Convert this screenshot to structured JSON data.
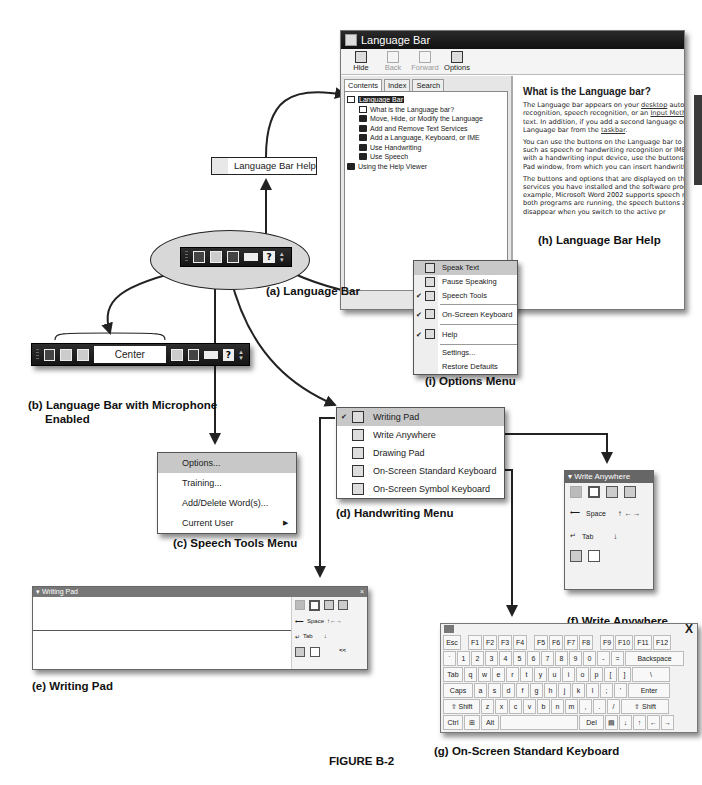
{
  "figure_label": "FIGURE B-2",
  "captions": {
    "a": "(a) Language Bar",
    "b_line1": "(b) Language Bar with Microphone",
    "b_line2": "Enabled",
    "c": "(c) Speech Tools Menu",
    "d": "(d) Handwriting Menu",
    "e": "(e) Writing Pad",
    "f": "(f) Write Anywhere",
    "g": "(g) On-Screen Standard Keyboard",
    "h": "(h) Language Bar Help",
    "i": "(i) Options Menu"
  },
  "help_window": {
    "title": "Language Bar",
    "toolbar": [
      {
        "label": "Hide",
        "enabled": true
      },
      {
        "label": "Back",
        "enabled": false
      },
      {
        "label": "Forward",
        "enabled": false
      },
      {
        "label": "Options",
        "enabled": true
      }
    ],
    "tabs": [
      "Contents",
      "Index",
      "Search"
    ],
    "tree": [
      {
        "label": "Language Bar",
        "level": 0,
        "icon": "open-book-icon",
        "selected": true
      },
      {
        "label": "What is the Language bar?",
        "level": 1,
        "icon": "page-icon"
      },
      {
        "label": "Move, Hide, or Modify the Language",
        "level": 1,
        "icon": "book-icon"
      },
      {
        "label": "Add and Remove Text Services",
        "level": 1,
        "icon": "book-icon"
      },
      {
        "label": "Add a Language, Keyboard, or IME",
        "level": 1,
        "icon": "book-icon"
      },
      {
        "label": "Use Handwriting",
        "level": 1,
        "icon": "book-icon"
      },
      {
        "label": "Use Speech",
        "level": 1,
        "icon": "book-icon"
      },
      {
        "label": "Using the Help Viewer",
        "level": 0,
        "icon": "book-icon"
      }
    ],
    "heading": "What is the Language bar?",
    "paragraphs": [
      [
        "The Language bar appears on your ",
        "desktop",
        " automa"
      ],
      [
        "recognition, speech recognition, or an ",
        "Input Method",
        ""
      ],
      [
        "text. In addition, if you add a second language or k",
        "",
        ""
      ],
      [
        "Language bar from the ",
        "taskbar",
        "."
      ]
    ],
    "para2": [
      "You can use the buttons on the Language bar to pe",
      "such as speech or handwriting recognition or IMEs.",
      "with a handwriting input device, use the buttons on t",
      "Pad window, from which you can insert handwritten"
    ],
    "para3": [
      "The buttons and options that are displayed on the",
      "services you have installed and the software progr",
      "example, Microsoft Word 2002 supports speech rec",
      "both programs are running, the speech buttons are",
      "disappear when you switch to the active pr"
    ]
  },
  "tooltip": {
    "label": "Language Bar Help"
  },
  "options_menu": {
    "items": [
      {
        "label": "Speak Text",
        "checked": false,
        "highlighted": true
      },
      {
        "label": "Pause Speaking",
        "checked": false
      },
      {
        "label": "Speech Tools",
        "checked": true
      },
      {
        "label": "On-Screen Keyboard",
        "checked": true
      },
      {
        "label": "Help",
        "checked": true
      },
      {
        "label": "Settings...",
        "checked": false
      },
      {
        "label": "Restore Defaults",
        "checked": false
      }
    ],
    "check_glyph": "✔"
  },
  "langbar_b": {
    "mode_label": "Center"
  },
  "speech_tools_menu": {
    "items": [
      {
        "label": "Options...",
        "highlighted": true
      },
      {
        "label": "Training..."
      },
      {
        "label": "Add/Delete Word(s)..."
      },
      {
        "label": "Current User",
        "submenu": true
      }
    ],
    "submenu_glyph": "▶"
  },
  "handwriting_menu": {
    "items": [
      {
        "label": "Writing Pad",
        "checked": true,
        "highlighted": true
      },
      {
        "label": "Write Anywhere"
      },
      {
        "label": "Drawing Pad"
      },
      {
        "label": "On-Screen Standard Keyboard"
      },
      {
        "label": "On-Screen Symbol Keyboard"
      }
    ]
  },
  "write_anywhere": {
    "title": "▾ Write Anywhere",
    "space_label": "Space",
    "tab_label": "Tab"
  },
  "writing_pad": {
    "title": "▾ Writing Pad",
    "close": "×",
    "space_label": "Space",
    "tab_label": "Tab",
    "collapse": "<<"
  },
  "keyboard": {
    "close": "X",
    "rows": [
      [
        "Esc",
        "",
        "F1",
        "F2",
        "F3",
        "F4",
        "",
        "F5",
        "F6",
        "F7",
        "F8",
        "",
        "F9",
        "F10",
        "F11",
        "F12"
      ],
      [
        "`",
        "1",
        "2",
        "3",
        "4",
        "5",
        "6",
        "7",
        "8",
        "9",
        "0",
        "-",
        "=",
        "Backspace"
      ],
      [
        "Tab",
        "q",
        "w",
        "e",
        "r",
        "t",
        "y",
        "u",
        "i",
        "o",
        "p",
        "[",
        "]",
        "\\"
      ],
      [
        "Caps",
        "a",
        "s",
        "d",
        "f",
        "g",
        "h",
        "j",
        "k",
        "l",
        ";",
        "'",
        "Enter"
      ],
      [
        "⇧ Shift",
        "z",
        "x",
        "c",
        "v",
        "b",
        "n",
        "m",
        ",",
        ".",
        "/",
        "⇧ Shift"
      ],
      [
        "Ctrl",
        "⊞",
        "Alt",
        " ",
        "Del",
        "▤",
        "↓",
        "↑",
        "←",
        "→"
      ]
    ]
  }
}
